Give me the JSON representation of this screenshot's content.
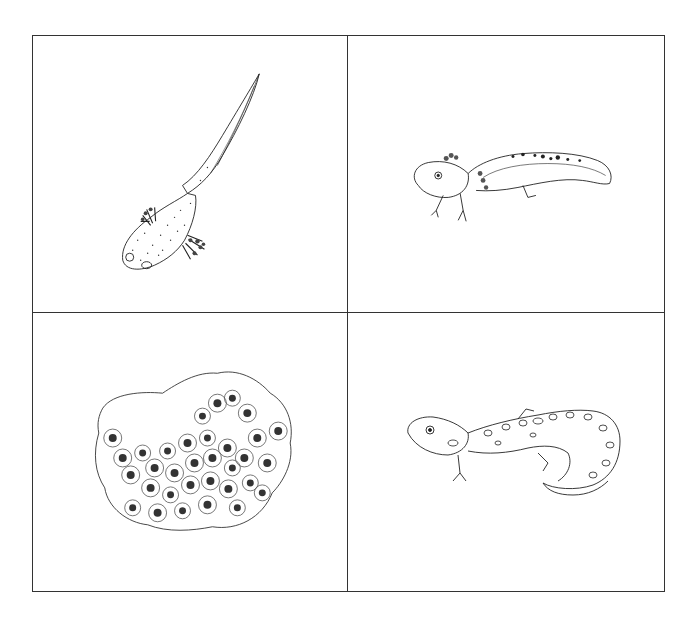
{
  "diagram": {
    "type": "life-cycle-grid",
    "layout": "2x2",
    "border_color": "#333333",
    "panels": [
      {
        "position": "top-left",
        "subject": "larva",
        "description": "Elongated salamander larva with tail fin and feathery external gills, viewed from above"
      },
      {
        "position": "top-right",
        "subject": "juvenile",
        "description": "Juvenile salamander with external gills, four legs and spotted dorsal fin"
      },
      {
        "position": "bottom-left",
        "subject": "egg-mass",
        "description": "Gelatinous egg mass containing many dark-centered eggs"
      },
      {
        "position": "bottom-right",
        "subject": "adult",
        "description": "Adult spotted salamander with blotchy pattern and curled tail"
      }
    ]
  }
}
